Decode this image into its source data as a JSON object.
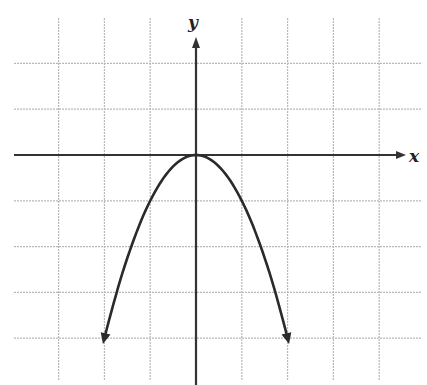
{
  "chart_data": {
    "type": "line",
    "title": "",
    "function": "y = -x^2",
    "xlabel": "x",
    "ylabel": "y",
    "xlim": [
      -4.2,
      4.6
    ],
    "ylim": [
      -5,
      3.5
    ],
    "grid": true,
    "grid_step": 1,
    "x": [
      -2,
      -1.5,
      -1,
      -0.5,
      0,
      0.5,
      1,
      1.5,
      2
    ],
    "series": [
      {
        "name": "parabola",
        "values": [
          -4,
          -2.25,
          -1,
          -0.25,
          0,
          -0.25,
          -1,
          -2.25,
          -4
        ]
      }
    ],
    "vertex": [
      0,
      0
    ],
    "endpoints_with_arrows": [
      [
        -2,
        -4
      ],
      [
        2,
        -4
      ]
    ],
    "tick_labels": []
  },
  "axes": {
    "x_label": "x",
    "y_label": "y"
  },
  "colors": {
    "grid": "#b8b8b8",
    "axis": "#333333",
    "curve": "#2a2a2a"
  }
}
